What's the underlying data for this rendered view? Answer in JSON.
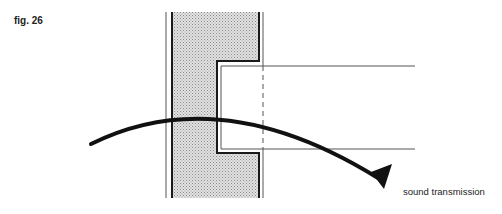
{
  "figure": {
    "label": "fig. 26",
    "annotation": "sound transmission",
    "colors": {
      "line": "#1a1a1a",
      "thin_line": "#555555",
      "wall_fill": "#cfcfcf"
    }
  }
}
